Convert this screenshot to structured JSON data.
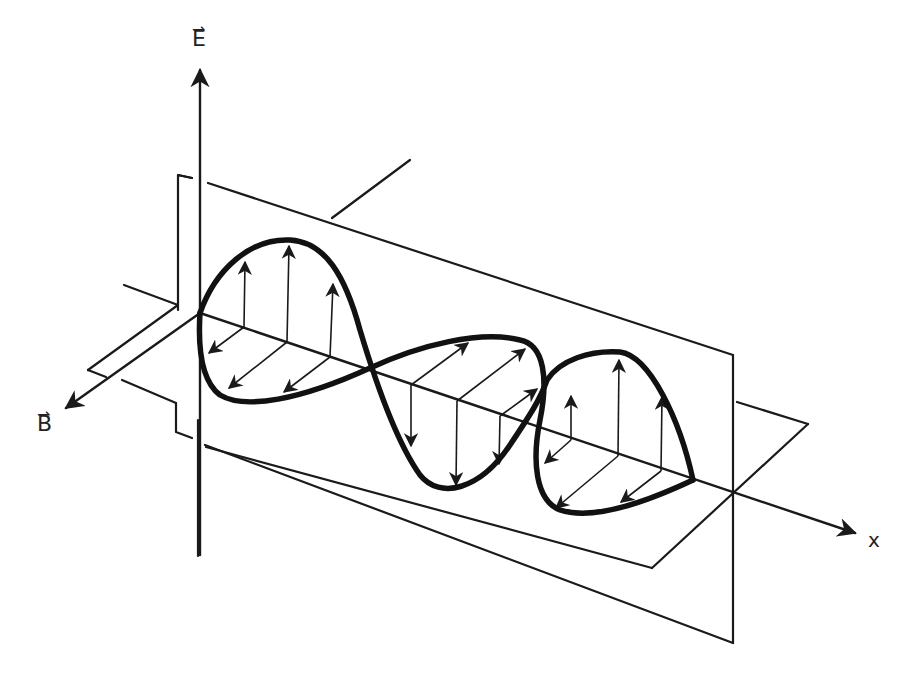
{
  "figure": {
    "labels": {
      "e_axis": "E",
      "b_axis": "B",
      "x_axis": "x",
      "vector_mark": "⇀"
    },
    "colors": {
      "ink": "#1a1a1a",
      "background": "#ffffff"
    },
    "components": {
      "e_field_plane": "vertical plane containing E-field vectors",
      "b_field_plane": "horizontal plane containing B-field vectors",
      "wave_curves": "sinusoidal E and B envelopes, 1.5 cycles shown",
      "e_vectors_up": 6,
      "e_vectors_down": 3,
      "b_vectors": 9
    }
  }
}
